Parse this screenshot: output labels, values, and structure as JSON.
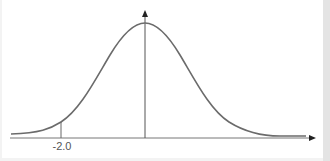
{
  "diagram": {
    "type": "normal-distribution-curve",
    "x_axis": {
      "arrow": true
    },
    "y_axis": {
      "arrow": true,
      "position": "mean"
    },
    "marker": {
      "label": "-2.0",
      "value": -2.0
    },
    "colors": {
      "curve": "#6b6b6b",
      "axis": "#555555",
      "background": "#ffffff",
      "border_strip": "#e4e4e4"
    }
  }
}
